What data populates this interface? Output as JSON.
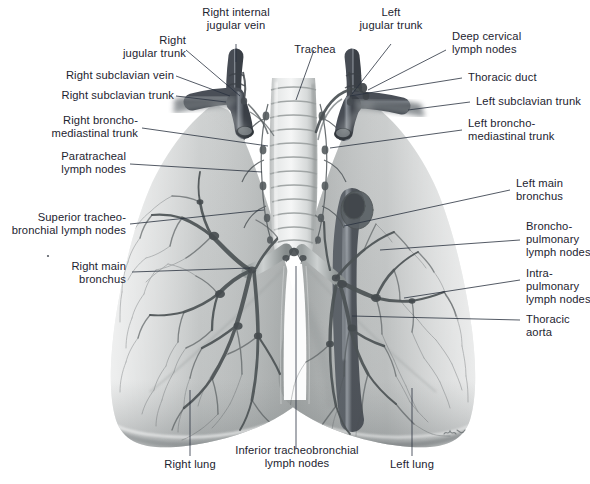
{
  "figure": {
    "background_color": "#ffffff",
    "label_color": "#1d2430",
    "leader_color": "#2b3340",
    "signature": "Voll"
  },
  "labels": {
    "right_internal_jugular_vein": "Right internal\njugular vein",
    "right_jugular_trunk": "Right\njugular trunk",
    "right_subclavian_vein": "Right subclavian vein",
    "right_subclavian_trunk": "Right subclavian trunk",
    "trachea": "Trachea",
    "left_jugular_trunk": "Left\njugular trunk",
    "deep_cervical_lymph_nodes": "Deep cervical\nlymph nodes",
    "thoracic_duct": "Thoracic duct",
    "left_subclavian_trunk": "Left subclavian trunk",
    "right_bronchomediastinal_trunk": "Right broncho-\nmediastinal trunk",
    "paratracheal_lymph_nodes": "Paratracheal\nlymph nodes",
    "left_bronchomediastinal_trunk": "Left broncho-\nmediastinal trunk",
    "left_main_bronchus": "Left main\nbronchus",
    "superior_tracheobronchial_lymph_nodes": "Superior tracheo-\nbronchial lymph nodes",
    "right_main_bronchus": "Right main\nbronchus",
    "bronchopulmonary_lymph_nodes": "Broncho-\npulmonary\nlymph nodes",
    "intrapulmonary_lymph_nodes": "Intra-\npulmonary\nlymph nodes",
    "thoracic_aorta": "Thoracic\naorta",
    "right_lung": "Right lung",
    "inferior_tracheobronchial_lymph_nodes": "Inferior tracheobronchial\nlymph nodes",
    "left_lung": "Left lung"
  }
}
